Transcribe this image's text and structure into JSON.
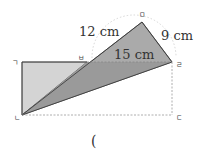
{
  "diagram": {
    "vertices": {
      "g": "ㄱ",
      "n": "ㄴ",
      "d": "ㄷ",
      "r": "ㄹ",
      "m": "ㅁ",
      "b": "ㅂ"
    },
    "measurements": {
      "side_nm_label": "12 cm",
      "side_mr_label": "9 cm",
      "side_nr_label": "15 cm"
    },
    "answer_blank": "(",
    "colors": {
      "light_fill": "#d4d4d4",
      "dark_fill": "#aaaaaa",
      "line": "#444444",
      "dashed": "#999999"
    }
  }
}
